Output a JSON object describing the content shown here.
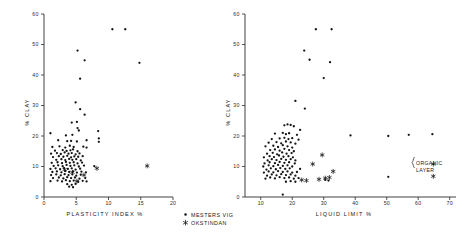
{
  "figure": {
    "series": [
      {
        "key": "mesters_vig",
        "label": "MESTERS VIG",
        "marker": "dot"
      },
      {
        "key": "okstindan",
        "label": "OKSTINDAN",
        "marker": "star"
      }
    ],
    "legend": {
      "name": "series-legend",
      "position": "bottom-center",
      "entries": [
        "MESTERS VIG",
        "OKSTINDAN"
      ]
    },
    "annotation": {
      "label_line1": "ORGANIC",
      "label_line2": "LAYER",
      "points_marked": 2
    }
  },
  "chart_data": [
    {
      "type": "scatter",
      "name": "plasticity-index-vs-clay",
      "title": "",
      "xlabel": "PLASTICITY  INDEX     %",
      "ylabel": "% CLAY",
      "xlim": [
        0,
        20
      ],
      "ylim": [
        0,
        60
      ],
      "xticks": [
        0,
        5,
        10,
        15,
        20
      ],
      "yticks": [
        0,
        10,
        20,
        30,
        40,
        50,
        60
      ],
      "xticklabels": [
        "0",
        "5",
        "10",
        "15",
        "20"
      ],
      "yticklabels": [
        "0",
        "10",
        "20",
        "30",
        "40",
        "50",
        "60"
      ],
      "grid": false,
      "series": [
        {
          "name": "MESTERS VIG",
          "marker": "dot",
          "points": [
            [
              10.6,
              55.0
            ],
            [
              12.6,
              55.0
            ],
            [
              5.2,
              48.0
            ],
            [
              6.3,
              44.8
            ],
            [
              14.8,
              44.0
            ],
            [
              5.6,
              38.8
            ],
            [
              4.9,
              31.0
            ],
            [
              5.6,
              28.8
            ],
            [
              6.3,
              27.0
            ],
            [
              4.3,
              24.4
            ],
            [
              5.1,
              24.6
            ],
            [
              5.2,
              22.6
            ],
            [
              5.4,
              21.8
            ],
            [
              8.4,
              21.6
            ],
            [
              1.0,
              20.9
            ],
            [
              3.4,
              20.2
            ],
            [
              4.4,
              20.4
            ],
            [
              8.5,
              19.2
            ],
            [
              8.5,
              18.1
            ],
            [
              2.2,
              18.6
            ],
            [
              3.6,
              18.3
            ],
            [
              4.2,
              18.4
            ],
            [
              5.1,
              18.2
            ],
            [
              6.6,
              18.6
            ],
            [
              1.3,
              16.4
            ],
            [
              2.4,
              16.6
            ],
            [
              3.3,
              16.2
            ],
            [
              4.0,
              16.8
            ],
            [
              4.6,
              16.4
            ],
            [
              6.1,
              16.5
            ],
            [
              6.6,
              16.2
            ],
            [
              1.7,
              15.2
            ],
            [
              2.9,
              15.4
            ],
            [
              3.5,
              15.1
            ],
            [
              4.1,
              15.3
            ],
            [
              4.5,
              15.6
            ],
            [
              5.2,
              15.0
            ],
            [
              1.1,
              14.2
            ],
            [
              2.0,
              14.4
            ],
            [
              2.6,
              14.1
            ],
            [
              3.2,
              14.6
            ],
            [
              3.8,
              14.2
            ],
            [
              4.3,
              14.4
            ],
            [
              4.9,
              14.0
            ],
            [
              5.5,
              14.3
            ],
            [
              1.4,
              13.1
            ],
            [
              2.3,
              13.4
            ],
            [
              3.0,
              13.2
            ],
            [
              3.6,
              13.5
            ],
            [
              4.2,
              13.0
            ],
            [
              4.7,
              13.3
            ],
            [
              5.3,
              13.2
            ],
            [
              6.0,
              13.4
            ],
            [
              1.9,
              12.2
            ],
            [
              2.7,
              12.4
            ],
            [
              3.3,
              12.1
            ],
            [
              3.9,
              12.5
            ],
            [
              4.4,
              12.2
            ],
            [
              5.0,
              12.4
            ],
            [
              5.7,
              12.0
            ],
            [
              1.2,
              11.2
            ],
            [
              2.1,
              11.4
            ],
            [
              2.8,
              11.1
            ],
            [
              3.4,
              11.5
            ],
            [
              4.0,
              11.2
            ],
            [
              4.6,
              11.4
            ],
            [
              5.2,
              11.0
            ],
            [
              5.9,
              11.3
            ],
            [
              1.5,
              10.2
            ],
            [
              2.2,
              10.4
            ],
            [
              2.9,
              10.1
            ],
            [
              3.5,
              10.5
            ],
            [
              4.1,
              10.2
            ],
            [
              4.7,
              10.4
            ],
            [
              5.4,
              10.0
            ],
            [
              6.2,
              10.3
            ],
            [
              7.8,
              10.1
            ],
            [
              1.0,
              9.2
            ],
            [
              1.8,
              9.4
            ],
            [
              2.5,
              9.1
            ],
            [
              3.1,
              9.5
            ],
            [
              3.7,
              9.2
            ],
            [
              4.3,
              9.4
            ],
            [
              4.9,
              9.0
            ],
            [
              5.6,
              9.3
            ],
            [
              1.3,
              8.2
            ],
            [
              2.0,
              8.4
            ],
            [
              2.7,
              8.1
            ],
            [
              3.3,
              8.5
            ],
            [
              3.9,
              8.2
            ],
            [
              4.5,
              8.4
            ],
            [
              5.1,
              8.0
            ],
            [
              5.8,
              8.3
            ],
            [
              6.5,
              8.1
            ],
            [
              1.1,
              7.2
            ],
            [
              1.9,
              7.4
            ],
            [
              2.6,
              7.1
            ],
            [
              3.2,
              7.5
            ],
            [
              3.8,
              7.2
            ],
            [
              4.4,
              7.4
            ],
            [
              5.0,
              7.0
            ],
            [
              5.7,
              7.3
            ],
            [
              1.4,
              6.2
            ],
            [
              2.3,
              6.4
            ],
            [
              3.0,
              6.1
            ],
            [
              3.6,
              6.5
            ],
            [
              4.2,
              6.2
            ],
            [
              4.8,
              6.4
            ],
            [
              5.5,
              6.0
            ],
            [
              6.4,
              6.2
            ],
            [
              1.0,
              5.2
            ],
            [
              2.1,
              5.4
            ],
            [
              2.8,
              5.1
            ],
            [
              3.4,
              5.5
            ],
            [
              4.0,
              5.2
            ],
            [
              4.6,
              5.4
            ],
            [
              5.3,
              5.0
            ],
            [
              6.0,
              5.3
            ],
            [
              6.6,
              5.1
            ],
            [
              3.6,
              4.2
            ],
            [
              4.3,
              4.0
            ],
            [
              4.9,
              4.3
            ],
            [
              3.9,
              3.4
            ],
            [
              4.5,
              3.2
            ]
          ]
        },
        {
          "name": "OKSTINDAN",
          "marker": "star",
          "points": [
            [
              8.2,
              9.4
            ],
            [
              6.2,
              7.2
            ],
            [
              4.4,
              8.1
            ],
            [
              3.2,
              9.0
            ],
            [
              16.0,
              10.2
            ],
            [
              5.1,
              5.2
            ]
          ]
        }
      ]
    },
    {
      "type": "scatter",
      "name": "liquid-limit-vs-clay",
      "title": "",
      "xlabel": "LIQUID     LIMIT    %",
      "ylabel": "% CLAY",
      "xlim": [
        5,
        72
      ],
      "ylim": [
        0,
        60
      ],
      "xticks": [
        10,
        20,
        30,
        40,
        50,
        60,
        70
      ],
      "yticks": [
        0,
        10,
        20,
        30,
        40,
        50,
        60
      ],
      "xticklabels": [
        "10",
        "20",
        "30",
        "40",
        "50",
        "60",
        "70"
      ],
      "yticklabels": [
        "0",
        "10",
        "20",
        "30",
        "40",
        "50",
        "60"
      ],
      "grid": false,
      "series": [
        {
          "name": "MESTERS VIG",
          "marker": "dot",
          "points": [
            [
              27.5,
              55.0
            ],
            [
              32.5,
              55.0
            ],
            [
              23.8,
              48.0
            ],
            [
              25.5,
              45.0
            ],
            [
              32.0,
              44.2
            ],
            [
              30.0,
              39.0
            ],
            [
              21.0,
              31.5
            ],
            [
              24.0,
              29.0
            ],
            [
              17.5,
              23.5
            ],
            [
              18.5,
              23.8
            ],
            [
              19.5,
              23.6
            ],
            [
              20.5,
              23.2
            ],
            [
              22.5,
              22.0
            ],
            [
              14.5,
              20.8
            ],
            [
              17.0,
              21.0
            ],
            [
              18.0,
              20.6
            ],
            [
              19.0,
              20.9
            ],
            [
              21.5,
              20.4
            ],
            [
              38.5,
              20.2
            ],
            [
              50.5,
              20.0
            ],
            [
              57.0,
              20.4
            ],
            [
              64.5,
              20.6
            ],
            [
              13.5,
              19.0
            ],
            [
              16.0,
              19.2
            ],
            [
              17.5,
              19.4
            ],
            [
              18.8,
              19.0
            ],
            [
              20.0,
              19.3
            ],
            [
              22.0,
              18.8
            ],
            [
              12.5,
              17.8
            ],
            [
              15.0,
              18.0
            ],
            [
              16.5,
              17.6
            ],
            [
              18.0,
              18.2
            ],
            [
              19.5,
              17.9
            ],
            [
              21.0,
              17.5
            ],
            [
              11.5,
              16.6
            ],
            [
              14.0,
              16.8
            ],
            [
              15.5,
              16.4
            ],
            [
              17.0,
              17.0
            ],
            [
              18.5,
              16.6
            ],
            [
              20.0,
              16.2
            ],
            [
              13.0,
              15.4
            ],
            [
              14.5,
              15.6
            ],
            [
              16.0,
              15.2
            ],
            [
              17.5,
              15.8
            ],
            [
              19.0,
              15.4
            ],
            [
              20.5,
              15.0
            ],
            [
              12.0,
              14.2
            ],
            [
              13.8,
              14.5
            ],
            [
              15.2,
              14.0
            ],
            [
              16.8,
              14.6
            ],
            [
              18.2,
              14.2
            ],
            [
              19.8,
              14.4
            ],
            [
              11.0,
              13.0
            ],
            [
              12.8,
              13.4
            ],
            [
              14.2,
              13.1
            ],
            [
              15.8,
              13.6
            ],
            [
              17.2,
              13.2
            ],
            [
              18.8,
              13.4
            ],
            [
              20.2,
              13.0
            ],
            [
              12.2,
              12.0
            ],
            [
              13.5,
              12.4
            ],
            [
              15.0,
              12.1
            ],
            [
              16.5,
              12.5
            ],
            [
              18.0,
              12.2
            ],
            [
              19.5,
              12.4
            ],
            [
              21.0,
              12.0
            ],
            [
              11.2,
              11.0
            ],
            [
              12.8,
              11.4
            ],
            [
              14.5,
              11.1
            ],
            [
              16.0,
              11.5
            ],
            [
              17.5,
              11.2
            ],
            [
              19.0,
              11.4
            ],
            [
              20.8,
              11.0
            ],
            [
              10.8,
              10.0
            ],
            [
              12.5,
              10.4
            ],
            [
              14.0,
              10.1
            ],
            [
              15.5,
              10.5
            ],
            [
              17.0,
              10.2
            ],
            [
              18.5,
              10.4
            ],
            [
              20.0,
              10.0
            ],
            [
              11.8,
              9.0
            ],
            [
              13.2,
              9.4
            ],
            [
              14.8,
              9.1
            ],
            [
              16.2,
              9.5
            ],
            [
              17.8,
              9.2
            ],
            [
              19.2,
              9.4
            ],
            [
              22.5,
              9.2
            ],
            [
              11.0,
              8.0
            ],
            [
              12.5,
              8.4
            ],
            [
              14.0,
              8.1
            ],
            [
              15.5,
              8.5
            ],
            [
              17.0,
              8.2
            ],
            [
              18.5,
              8.4
            ],
            [
              20.0,
              8.0
            ],
            [
              21.5,
              8.2
            ],
            [
              12.0,
              7.0
            ],
            [
              13.5,
              7.4
            ],
            [
              15.0,
              7.1
            ],
            [
              16.5,
              7.5
            ],
            [
              18.0,
              7.2
            ],
            [
              19.5,
              7.4
            ],
            [
              21.0,
              7.0
            ],
            [
              11.5,
              6.0
            ],
            [
              13.0,
              6.4
            ],
            [
              14.5,
              6.1
            ],
            [
              16.0,
              6.5
            ],
            [
              17.5,
              6.2
            ],
            [
              19.0,
              6.4
            ],
            [
              20.5,
              6.0
            ],
            [
              22.0,
              6.2
            ],
            [
              50.5,
              6.6
            ],
            [
              30.5,
              5.6
            ],
            [
              31.5,
              5.4
            ],
            [
              18.0,
              5.0
            ],
            [
              19.5,
              5.2
            ],
            [
              21.0,
              5.0
            ],
            [
              17.0,
              0.8
            ]
          ]
        },
        {
          "name": "OKSTINDAN",
          "marker": "star",
          "points": [
            [
              29.5,
              13.8
            ],
            [
              26.5,
              10.8
            ],
            [
              33.0,
              8.4
            ],
            [
              30.5,
              6.2
            ],
            [
              31.8,
              6.4
            ],
            [
              28.5,
              5.8
            ],
            [
              24.5,
              5.4
            ],
            [
              23.0,
              5.6
            ],
            [
              64.8,
              10.8
            ],
            [
              64.8,
              6.8
            ]
          ]
        }
      ]
    }
  ]
}
